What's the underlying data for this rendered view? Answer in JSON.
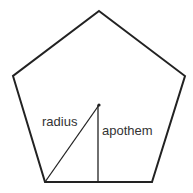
{
  "diagram": {
    "shape": "regular pentagon",
    "labels": {
      "radius": "radius",
      "apothem": "apothem"
    },
    "colors": {
      "stroke": "#222222",
      "text": "#333333",
      "background": "#ffffff"
    }
  }
}
